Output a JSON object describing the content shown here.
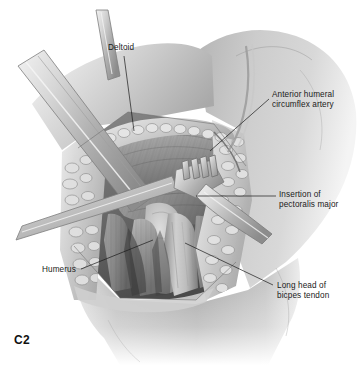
{
  "figure": {
    "id_label": "C2",
    "background_color": "#ffffff",
    "ink_color": "#1a1a1a",
    "width": 361,
    "height": 365,
    "style": "grayscale medical illustration"
  },
  "labels": [
    {
      "key": "deltoid",
      "text": "Deltoid",
      "lines": [
        "Deltoid"
      ],
      "x": 108,
      "y": 43,
      "leader": {
        "from_x": 124,
        "from_y": 56,
        "to_x": 134,
        "to_y": 131
      }
    },
    {
      "key": "anterior_humeral_circumflex_artery",
      "text": "Anterior humeral circumflex artery",
      "lines": [
        "Anterior humeral",
        "circumflex artery"
      ],
      "x": 272,
      "y": 90,
      "leader": {
        "from_x": 269,
        "from_y": 99,
        "to_x": 210,
        "to_y": 151
      }
    },
    {
      "key": "insertion_of_pectoralis_major",
      "text": "Insertion of pectoralis major",
      "lines": [
        "Insertion of",
        "pectoralis major"
      ],
      "x": 279,
      "y": 190,
      "leader": {
        "from_x": 276,
        "from_y": 196,
        "to_x": 196,
        "to_y": 196
      }
    },
    {
      "key": "humerus",
      "text": "Humerus",
      "lines": [
        "Humerus"
      ],
      "x": 42,
      "y": 265,
      "leader": {
        "from_x": 81,
        "from_y": 269,
        "to_x": 153,
        "to_y": 240
      }
    },
    {
      "key": "long_head_of_biceps_tendon",
      "text": "Long head of bicpes tendon",
      "lines": [
        "Long head of",
        "bicpes tendon"
      ],
      "x": 277,
      "y": 281,
      "leader": {
        "from_x": 273,
        "from_y": 285,
        "to_x": 185,
        "to_y": 243
      }
    }
  ],
  "anatomy": {
    "structures": [
      "deltoid muscle",
      "pectoralis major insertion",
      "long head of biceps tendon",
      "humerus",
      "anterior humeral circumflex artery",
      "subcutaneous fat at wound margin",
      "skin of shoulder and upper arm"
    ],
    "instruments": [
      "flat ribbon retractor (upper left, diagonal)",
      "narrow retractor blade (mid left, diagonal)",
      "four-prong rake retractor (center)",
      "retractor handle (lower right)"
    ]
  }
}
